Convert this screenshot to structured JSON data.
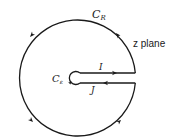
{
  "diagram": {
    "type": "keyhole-contour",
    "labels": {
      "outer_circle": "C",
      "outer_circle_sub": "R",
      "inner_circle": "C",
      "inner_circle_sub": "ε",
      "upper_segment": "I",
      "lower_segment": "J",
      "plane": "z plane"
    },
    "colors": {
      "stroke": "#1a1a1a",
      "background": "#ffffff"
    },
    "orientation": "counterclockwise outer, I toward right, J toward left"
  }
}
